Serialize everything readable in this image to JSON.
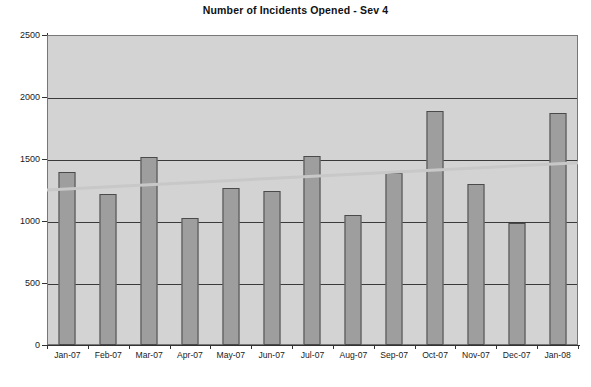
{
  "chart_data": {
    "type": "bar",
    "title": "Number of Incidents Opened - Sev 4",
    "xlabel": "",
    "ylabel": "",
    "categories": [
      "Jan-07",
      "Feb-07",
      "Mar-07",
      "Apr-07",
      "May-07",
      "Jun-07",
      "Jul-07",
      "Aug-07",
      "Sep-07",
      "Oct-07",
      "Nov-07",
      "Dec-07",
      "Jan-08"
    ],
    "values": [
      1395,
      1220,
      1515,
      1025,
      1270,
      1240,
      1525,
      1050,
      1390,
      1890,
      1295,
      985,
      1870
    ],
    "series": [
      {
        "name": "Number of Incidents Opened - Sev 4",
        "type": "bar",
        "values": [
          1395,
          1220,
          1515,
          1025,
          1270,
          1240,
          1525,
          1050,
          1390,
          1890,
          1295,
          985,
          1870
        ]
      },
      {
        "name": "Linear trend",
        "type": "line",
        "start_value": 1250,
        "end_value": 1470,
        "values": [
          1250,
          1268,
          1287,
          1305,
          1323,
          1342,
          1360,
          1378,
          1397,
          1415,
          1433,
          1452,
          1470
        ]
      }
    ],
    "ylim": [
      0,
      2500
    ],
    "yticks": [
      0,
      500,
      1000,
      1500,
      2000,
      2500
    ],
    "ytick_labels": [
      "0",
      "500",
      "1000",
      "1500",
      "2000",
      "2500"
    ],
    "grid": true,
    "grid_axis": "y",
    "legend": false,
    "legend_position": "none",
    "plot_background_color": "#d3d3d3",
    "bar_color": "#9e9e9e",
    "bar_border_color": "#4a4a4a",
    "gridline_color": "#3a3a3a",
    "trendline_color": "#c8c8c8",
    "annotations": []
  }
}
